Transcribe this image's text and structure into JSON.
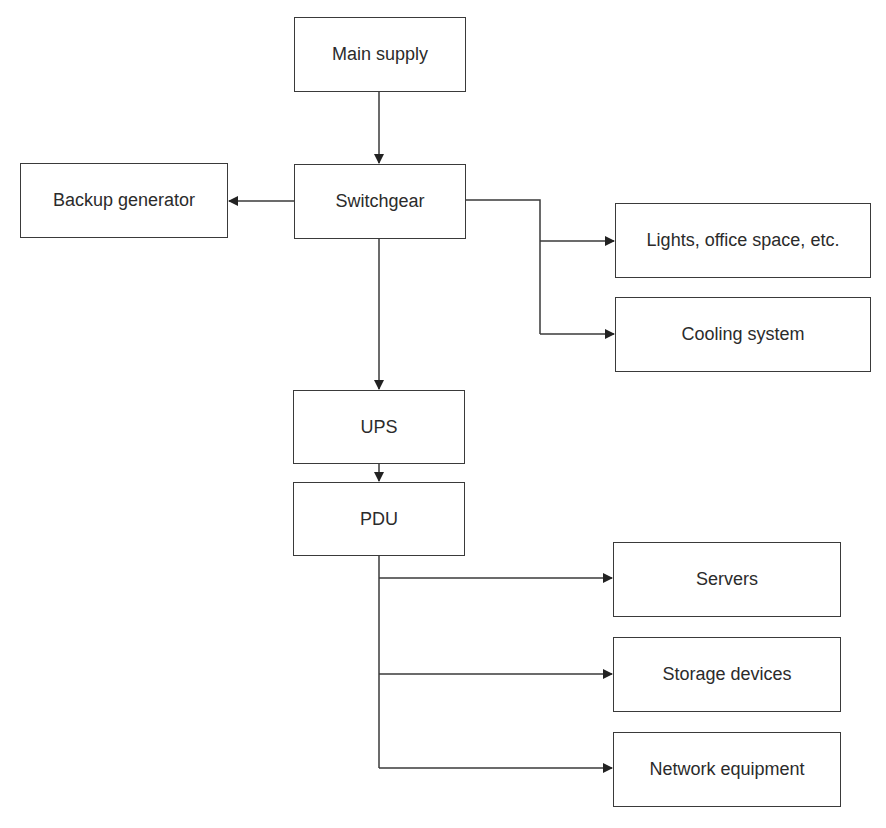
{
  "diagram": {
    "type": "flowchart",
    "nodes": [
      {
        "id": "main_supply",
        "label": "Main supply",
        "x": 294,
        "y": 17,
        "w": 172,
        "h": 75
      },
      {
        "id": "switchgear",
        "label": "Switchgear",
        "x": 294,
        "y": 164,
        "w": 172,
        "h": 75
      },
      {
        "id": "backup_generator",
        "label": "Backup generator",
        "x": 20,
        "y": 163,
        "w": 208,
        "h": 75
      },
      {
        "id": "lights",
        "label": "Lights, office space, etc.",
        "x": 615,
        "y": 203,
        "w": 256,
        "h": 75
      },
      {
        "id": "cooling",
        "label": "Cooling system",
        "x": 615,
        "y": 297,
        "w": 256,
        "h": 75
      },
      {
        "id": "ups",
        "label": "UPS",
        "x": 293,
        "y": 390,
        "w": 172,
        "h": 74
      },
      {
        "id": "pdu",
        "label": "PDU",
        "x": 293,
        "y": 482,
        "w": 172,
        "h": 74
      },
      {
        "id": "servers",
        "label": "Servers",
        "x": 613,
        "y": 542,
        "w": 228,
        "h": 75
      },
      {
        "id": "storage",
        "label": "Storage devices",
        "x": 613,
        "y": 637,
        "w": 228,
        "h": 75
      },
      {
        "id": "network",
        "label": "Network equipment",
        "x": 613,
        "y": 732,
        "w": 228,
        "h": 75
      }
    ],
    "edges": [
      {
        "from": "main_supply",
        "to": "switchgear"
      },
      {
        "from": "switchgear",
        "to": "backup_generator"
      },
      {
        "from": "switchgear",
        "to": "lights"
      },
      {
        "from": "switchgear",
        "to": "cooling"
      },
      {
        "from": "switchgear",
        "to": "ups"
      },
      {
        "from": "ups",
        "to": "pdu"
      },
      {
        "from": "pdu",
        "to": "servers"
      },
      {
        "from": "pdu",
        "to": "storage"
      },
      {
        "from": "pdu",
        "to": "network"
      }
    ],
    "colors": {
      "line": "#3a3a3a",
      "box_border": "#3a3a3a",
      "text": "#2b2b2b",
      "background": "#ffffff"
    }
  }
}
